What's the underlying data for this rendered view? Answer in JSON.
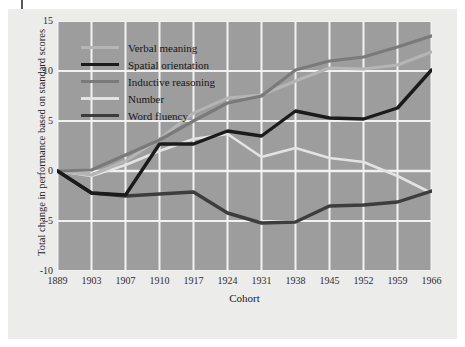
{
  "chart_data": {
    "type": "line",
    "title": "",
    "xlabel": "Cohort",
    "ylabel": "Total change in performance based on standard scores",
    "categories": [
      "1889",
      "1903",
      "1907",
      "1910",
      "1917",
      "1924",
      "1931",
      "1938",
      "1945",
      "1952",
      "1959",
      "1966"
    ],
    "x": [
      1889,
      1903,
      1907,
      1910,
      1917,
      1924,
      1931,
      1938,
      1945,
      1952,
      1959,
      1966
    ],
    "ylim": [
      -10,
      15
    ],
    "yticks": [
      "15",
      "10",
      "5",
      "0",
      "-5",
      "-10"
    ],
    "ytick_values": [
      15,
      10,
      5,
      0,
      -5,
      -10
    ],
    "grid": true,
    "legend_position": "upper-left",
    "series": [
      {
        "name": "Verbal meaning",
        "color": "#b5b5b5",
        "width": 3.0,
        "values": [
          0,
          -0.4,
          1.0,
          3.2,
          5.8,
          7.3,
          7.6,
          9.0,
          10.3,
          10.2,
          10.6,
          11.9
        ]
      },
      {
        "name": "Spatial orientation",
        "color": "#1b1b1b",
        "width": 3.4,
        "values": [
          0,
          -2.2,
          -2.4,
          2.7,
          2.7,
          4.0,
          3.5,
          6.0,
          5.3,
          5.2,
          6.3,
          10.1
        ]
      },
      {
        "name": "Inductive reasoning",
        "color": "#7a7a7a",
        "width": 3.2,
        "values": [
          0,
          0.1,
          1.6,
          3.1,
          5.0,
          6.8,
          7.5,
          10.1,
          11.0,
          11.4,
          12.4,
          13.5
        ]
      },
      {
        "name": "Number",
        "color": "#e3e3e3",
        "width": 2.6,
        "values": [
          0,
          -0.5,
          0.6,
          2.0,
          3.2,
          3.7,
          1.4,
          2.3,
          1.3,
          0.9,
          -0.5,
          -2.2
        ]
      },
      {
        "name": "Word fluency",
        "color": "#3d3d3d",
        "width": 3.4,
        "values": [
          0,
          -2.2,
          -2.5,
          -2.3,
          -2.1,
          -4.2,
          -5.2,
          -5.1,
          -3.5,
          -3.4,
          -3.1,
          -2.0
        ]
      }
    ]
  },
  "axis": {
    "x_title": "Cohort",
    "y_title": "Total change in performance based on standard scores"
  },
  "style": {
    "plot_background": "#9d9d9d",
    "page_background": "#ececeb",
    "grid_color": "#f2f2f2",
    "tick_text_color": "#2c2c2c"
  }
}
